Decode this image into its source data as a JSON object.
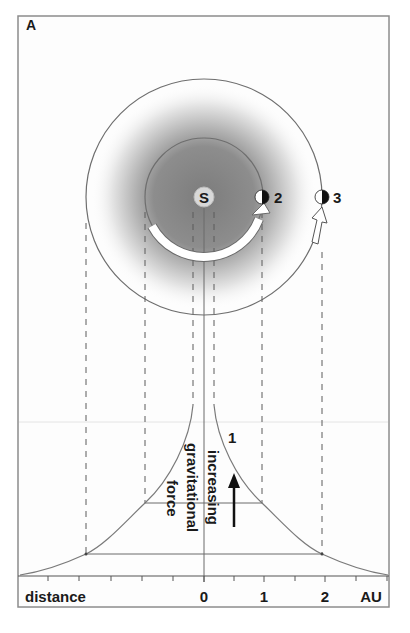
{
  "figure": {
    "panel_label": "A",
    "sun": {
      "label": "S",
      "cx": 204,
      "cy": 197,
      "r": 10
    },
    "orbits": [
      {
        "name": "inner-orbit",
        "r": 59
      },
      {
        "name": "outer-orbit",
        "r": 118
      }
    ],
    "planets": [
      {
        "id": "2",
        "label": "2",
        "cx": 262,
        "cy": 197
      },
      {
        "id": "3",
        "label": "3",
        "cx": 322,
        "cy": 197
      }
    ],
    "curve_label": "1",
    "vertical_text": {
      "line1": "increasing",
      "line2": "gravitational",
      "line3": "force"
    },
    "axis": {
      "title": "distance",
      "unit": "AU",
      "tick_labels": [
        "0",
        "1",
        "2"
      ],
      "tick_values_au": [
        0,
        1,
        2
      ]
    },
    "colors": {
      "shading_dark": "#8a8a8a",
      "line": "#6e6e6e",
      "text": "#1a1a1a",
      "frame": "#8c8c8c"
    }
  }
}
